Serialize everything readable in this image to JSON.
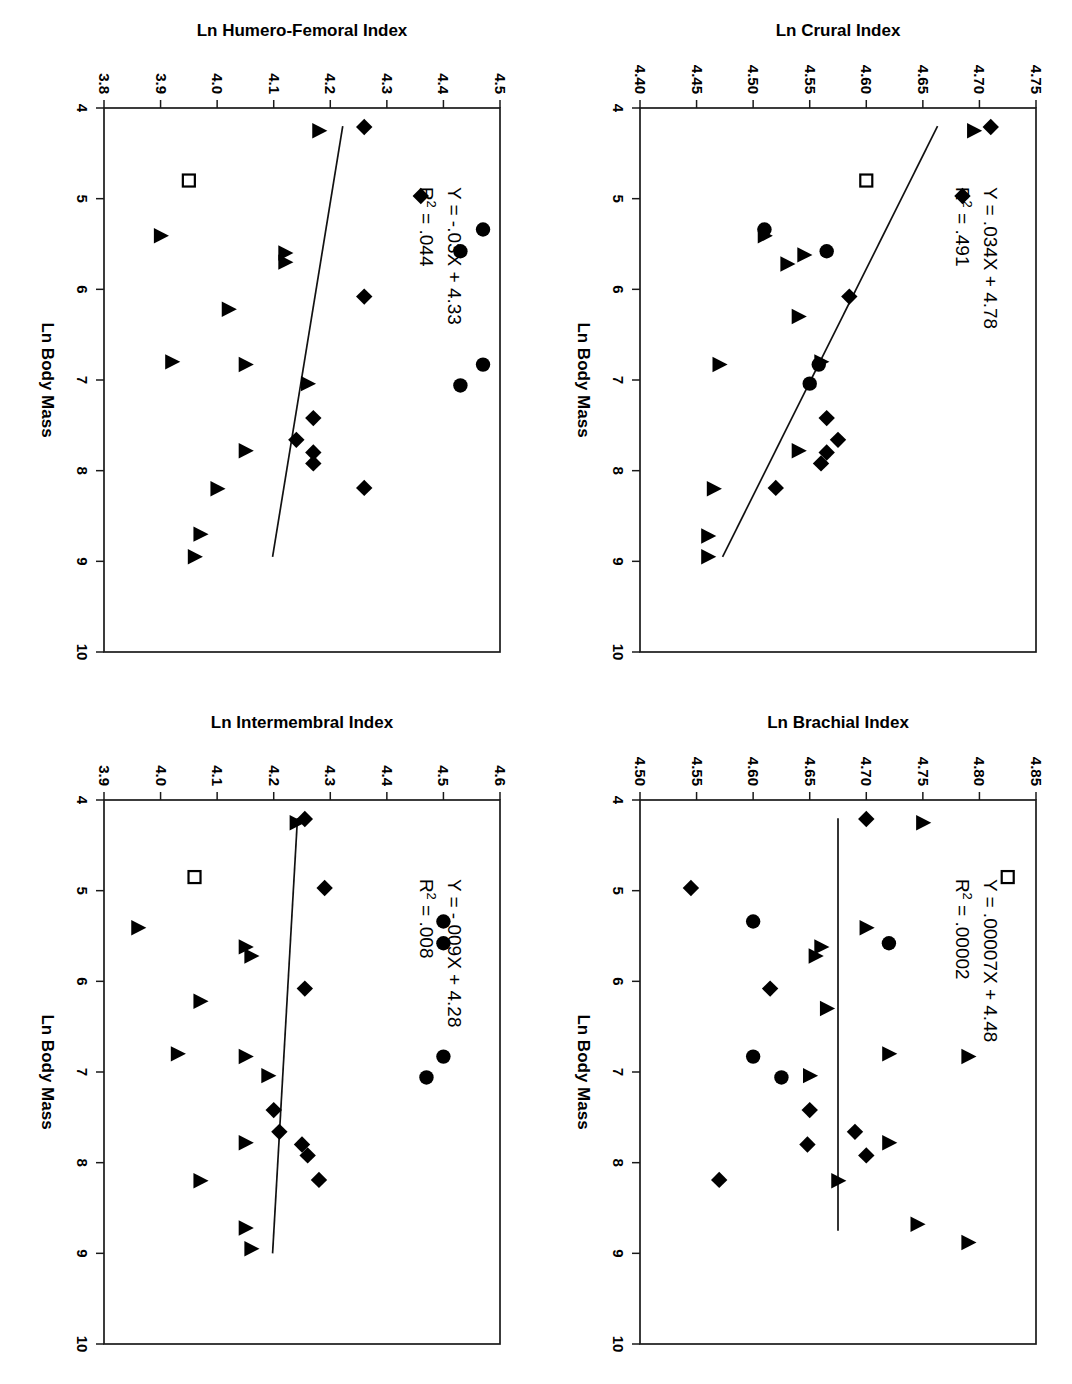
{
  "figure": {
    "layout": "2x2 grid of scatter plots, page rotated 90 degrees clockwise",
    "background": "#ffffff",
    "ink_color": "#000000"
  },
  "shared": {
    "xlabel": "Ln Body Mass",
    "xticks": [
      "4",
      "5",
      "6",
      "7",
      "8",
      "9",
      "10"
    ],
    "xlim": [
      4,
      10
    ]
  },
  "chart_data": [
    {
      "id": "intermembral",
      "position": "bottom-left",
      "type": "scatter",
      "title": "",
      "xlabel": "Ln Body Mass",
      "ylabel": "Ln Intermembral Index",
      "xlim": [
        4,
        10
      ],
      "ylim": [
        3.9,
        4.6
      ],
      "xticks": [
        "4",
        "5",
        "6",
        "7",
        "8",
        "9",
        "10"
      ],
      "yticks": [
        "3.9",
        "4.0",
        "4.1",
        "4.2",
        "4.3",
        "4.4",
        "4.5",
        "4.6"
      ],
      "grid": false,
      "legend": "none",
      "annotations": {
        "equation": "Y = -.009X + 4.28",
        "r_squared_prefix": "R",
        "r_squared_sup": "2",
        "r_squared_value": " = .008"
      },
      "fit": {
        "slope": -0.009,
        "intercept": 4.28,
        "x_from": 4.2,
        "x_to": 9.0
      },
      "series": [
        {
          "name": "diamond",
          "marker": "diamond",
          "points": [
            [
              4.21,
              4.255
            ],
            [
              4.97,
              4.29
            ],
            [
              6.08,
              4.255
            ],
            [
              7.42,
              4.2
            ],
            [
              7.66,
              4.21
            ],
            [
              7.8,
              4.25
            ],
            [
              7.92,
              4.26
            ],
            [
              8.19,
              4.28
            ]
          ]
        },
        {
          "name": "circle",
          "marker": "circle",
          "points": [
            [
              5.34,
              4.5
            ],
            [
              5.58,
              4.5
            ],
            [
              6.83,
              4.5
            ],
            [
              7.06,
              4.47
            ]
          ]
        },
        {
          "name": "triangle",
          "marker": "triangle",
          "points": [
            [
              4.25,
              4.24
            ],
            [
              5.41,
              3.96
            ],
            [
              5.62,
              4.15
            ],
            [
              5.72,
              4.16
            ],
            [
              6.22,
              4.07
            ],
            [
              6.8,
              4.03
            ],
            [
              6.83,
              4.15
            ],
            [
              7.04,
              4.19
            ],
            [
              7.78,
              4.15
            ],
            [
              8.2,
              4.07
            ],
            [
              8.72,
              4.15
            ],
            [
              8.95,
              4.16
            ]
          ]
        },
        {
          "name": "open-square",
          "marker": "open-square",
          "points": [
            [
              4.85,
              4.06
            ]
          ]
        }
      ]
    },
    {
      "id": "humero-femoral",
      "position": "top-left",
      "type": "scatter",
      "title": "",
      "xlabel": "Ln Body Mass",
      "ylabel": "Ln Humero-Femoral Index",
      "xlim": [
        4,
        10
      ],
      "ylim": [
        3.8,
        4.5
      ],
      "xticks": [
        "4",
        "5",
        "6",
        "7",
        "8",
        "9",
        "10"
      ],
      "yticks": [
        "3.8",
        "3.9",
        "4.0",
        "4.1",
        "4.2",
        "4.3",
        "4.4",
        "4.5"
      ],
      "grid": false,
      "legend": "none",
      "annotations": {
        "equation": "Y = -.03X + 4.33",
        "r_squared_prefix": "R",
        "r_squared_sup": "2",
        "r_squared_value": " = .044"
      },
      "fit": {
        "slope": -0.03,
        "intercept": 4.33,
        "x_from": 4.2,
        "x_to": 8.95
      },
      "series": [
        {
          "name": "diamond",
          "marker": "diamond",
          "points": [
            [
              4.21,
              4.26
            ],
            [
              4.97,
              4.36
            ],
            [
              6.08,
              4.26
            ],
            [
              7.42,
              4.17
            ],
            [
              7.66,
              4.14
            ],
            [
              7.8,
              4.17
            ],
            [
              7.92,
              4.17
            ],
            [
              8.19,
              4.26
            ]
          ]
        },
        {
          "name": "circle",
          "marker": "circle",
          "points": [
            [
              5.34,
              4.47
            ],
            [
              5.58,
              4.43
            ],
            [
              6.83,
              4.47
            ],
            [
              7.06,
              4.43
            ]
          ]
        },
        {
          "name": "triangle",
          "marker": "triangle",
          "points": [
            [
              4.25,
              4.18
            ],
            [
              5.41,
              3.9
            ],
            [
              5.6,
              4.12
            ],
            [
              5.7,
              4.12
            ],
            [
              6.22,
              4.02
            ],
            [
              6.8,
              3.92
            ],
            [
              6.83,
              4.05
            ],
            [
              7.04,
              4.16
            ],
            [
              7.78,
              4.05
            ],
            [
              8.2,
              4.0
            ],
            [
              8.7,
              3.97
            ],
            [
              8.95,
              3.96
            ]
          ]
        },
        {
          "name": "open-square",
          "marker": "open-square",
          "points": [
            [
              4.8,
              3.95
            ]
          ]
        }
      ]
    },
    {
      "id": "brachial",
      "position": "bottom-right",
      "type": "scatter",
      "title": "",
      "xlabel": "Ln Body Mass",
      "ylabel": "Ln Brachial Index",
      "xlim": [
        4,
        10
      ],
      "ylim": [
        4.5,
        4.85
      ],
      "xticks": [
        "4",
        "5",
        "6",
        "7",
        "8",
        "9",
        "10"
      ],
      "yticks": [
        "4.50",
        "4.55",
        "4.60",
        "4.65",
        "4.70",
        "4.75",
        "4.80",
        "4.85"
      ],
      "grid": false,
      "legend": "none",
      "annotations": {
        "equation": "Y = .00007X + 4.48",
        "r_squared_prefix": "R",
        "r_squared_sup": "2",
        "r_squared_value": " = .00002"
      },
      "fit": {
        "slope": 7e-05,
        "intercept": 4.675,
        "x_from": 4.2,
        "x_to": 8.75
      },
      "series": [
        {
          "name": "diamond",
          "marker": "diamond",
          "points": [
            [
              4.21,
              4.7
            ],
            [
              4.97,
              4.545
            ],
            [
              6.08,
              4.615
            ],
            [
              7.42,
              4.65
            ],
            [
              7.66,
              4.69
            ],
            [
              7.8,
              4.648
            ],
            [
              7.92,
              4.7
            ],
            [
              8.19,
              4.57
            ]
          ]
        },
        {
          "name": "circle",
          "marker": "circle",
          "points": [
            [
              5.34,
              4.6
            ],
            [
              5.58,
              4.72
            ],
            [
              6.83,
              4.6
            ],
            [
              7.06,
              4.625
            ]
          ]
        },
        {
          "name": "triangle",
          "marker": "triangle",
          "points": [
            [
              4.25,
              4.75
            ],
            [
              5.41,
              4.7
            ],
            [
              5.62,
              4.66
            ],
            [
              5.72,
              4.655
            ],
            [
              6.3,
              4.665
            ],
            [
              6.8,
              4.72
            ],
            [
              6.83,
              4.79
            ],
            [
              7.04,
              4.65
            ],
            [
              7.78,
              4.72
            ],
            [
              8.2,
              4.675
            ],
            [
              8.68,
              4.745
            ],
            [
              8.88,
              4.79
            ]
          ]
        },
        {
          "name": "open-square",
          "marker": "open-square",
          "points": [
            [
              4.85,
              4.825
            ]
          ]
        }
      ]
    },
    {
      "id": "crural",
      "position": "top-right",
      "type": "scatter",
      "title": "",
      "xlabel": "Ln Body Mass",
      "ylabel": "Ln Crural Index",
      "xlim": [
        4,
        10
      ],
      "ylim": [
        4.4,
        4.75
      ],
      "xticks": [
        "4",
        "5",
        "6",
        "7",
        "8",
        "9",
        "10"
      ],
      "yticks": [
        "4.40",
        "4.45",
        "4.50",
        "4.55",
        "4.60",
        "4.65",
        "4.70",
        "4.75"
      ],
      "grid": false,
      "legend": "none",
      "annotations": {
        "equation": "Y = .034X + 4.78",
        "r_squared_prefix": "R",
        "r_squared_sup": "2",
        "r_squared_value": " = .491"
      },
      "fit": {
        "slope": -0.034,
        "intercept": 4.805,
        "x_from": 4.2,
        "x_to": 8.95
      },
      "series": [
        {
          "name": "diamond",
          "marker": "diamond",
          "points": [
            [
              4.21,
              4.71
            ],
            [
              4.97,
              4.685
            ],
            [
              6.08,
              4.585
            ],
            [
              7.42,
              4.565
            ],
            [
              7.66,
              4.575
            ],
            [
              7.8,
              4.565
            ],
            [
              7.92,
              4.56
            ],
            [
              8.19,
              4.52
            ]
          ]
        },
        {
          "name": "circle",
          "marker": "circle",
          "points": [
            [
              5.34,
              4.51
            ],
            [
              5.58,
              4.565
            ],
            [
              6.83,
              4.558
            ],
            [
              7.04,
              4.55
            ]
          ]
        },
        {
          "name": "triangle",
          "marker": "triangle",
          "points": [
            [
              4.25,
              4.695
            ],
            [
              5.41,
              4.51
            ],
            [
              5.62,
              4.545
            ],
            [
              5.72,
              4.53
            ],
            [
              6.3,
              4.54
            ],
            [
              6.8,
              4.56
            ],
            [
              6.83,
              4.47
            ],
            [
              7.78,
              4.54
            ],
            [
              8.2,
              4.465
            ],
            [
              8.72,
              4.46
            ],
            [
              8.95,
              4.46
            ]
          ]
        },
        {
          "name": "open-square",
          "marker": "open-square",
          "points": [
            [
              4.8,
              4.6
            ]
          ]
        }
      ]
    }
  ]
}
